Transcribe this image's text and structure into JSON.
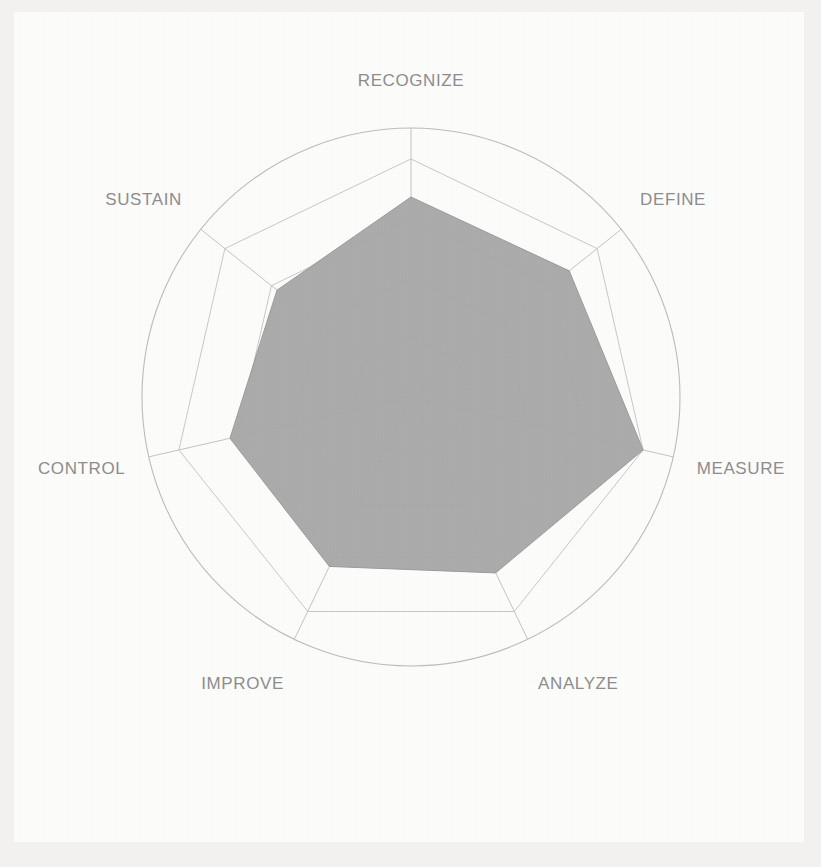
{
  "chart_data": {
    "type": "radar",
    "title": "",
    "subtitle": "",
    "xlabel": "",
    "ylabel": "",
    "grid": true,
    "legend_position": "none",
    "rings": 4,
    "rmin": 0,
    "rmax": 1,
    "start_angle_deg": -90,
    "direction": "clockwise",
    "categories": [
      "RECOGNIZE",
      "DEFINE",
      "MEASURE",
      "ANALYZE",
      "IMPROVE",
      "CONTROL",
      "SUSTAIN"
    ],
    "series": [
      {
        "name": "Assessment",
        "values": [
          0.84,
          0.85,
          1.0,
          0.82,
          0.79,
          0.78,
          0.72
        ],
        "fill_color": "#a8a8a8",
        "line_color": "#9c9c9c"
      }
    ],
    "tick_labels": [],
    "annotations": []
  },
  "labels": {
    "recognize": "RECOGNIZE",
    "define": "DEFINE",
    "measure": "MEASURE",
    "analyze": "ANALYZE",
    "improve": "IMPROVE",
    "control": "CONTROL",
    "sustain": "SUSTAIN"
  },
  "colors": {
    "page_background": "#f4f3f1",
    "plot_background": "#fdfdfc",
    "grid": "#c9c9c9",
    "outer_ring": "#bdbdbd",
    "spoke": "#c4c4c4",
    "series_fill": "#a8a8a8",
    "label_text": "#8e8e8e"
  }
}
